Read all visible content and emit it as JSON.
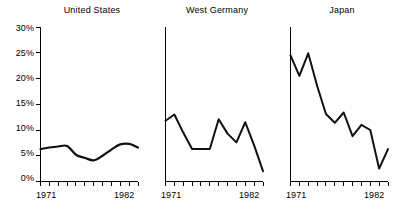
{
  "chart_data": {
    "type": "line",
    "title": "",
    "xlabel": "",
    "ylabel": "",
    "ylim": [
      0,
      30
    ],
    "xlim": [
      1971,
      1982
    ],
    "grid": false,
    "legend": "none",
    "ytick_labels": [
      "0%",
      "5%",
      "10%",
      "15%",
      "20%",
      "25%",
      "30%"
    ],
    "ytick_values": [
      0,
      5,
      10,
      15,
      20,
      25,
      30
    ],
    "x": [
      1971,
      1972,
      1973,
      1974,
      1975,
      1976,
      1977,
      1978,
      1979,
      1980,
      1981,
      1982
    ],
    "xtick_labels": [
      "1971",
      "1982"
    ],
    "panels": [
      {
        "title": "United States",
        "x_start_label": "1971",
        "x_end_label": "1982",
        "values": [
          6.3,
          6.6,
          6.8,
          6.9,
          5.2,
          4.6,
          4.1,
          5.0,
          6.2,
          7.2,
          7.3,
          6.6
        ]
      },
      {
        "title": "West Germany",
        "x_start_label": "1971",
        "x_end_label": "1982",
        "values": [
          11.8,
          13.0,
          9.5,
          6.3,
          6.3,
          6.3,
          12.1,
          9.3,
          7.6,
          11.5,
          7.0,
          2.0
        ]
      },
      {
        "title": "Japan",
        "x_start_label": "1971",
        "x_end_label": "1982",
        "values": [
          24.5,
          20.5,
          24.9,
          18.6,
          13.1,
          11.4,
          13.4,
          8.8,
          11.0,
          10.0,
          2.5,
          6.3
        ]
      }
    ]
  }
}
